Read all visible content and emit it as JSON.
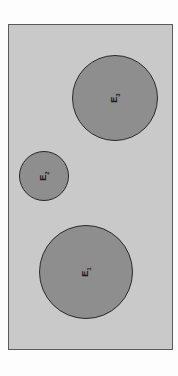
{
  "diagram": {
    "background_color": "#c9c9c9",
    "circle_fill": "#8e8e8e",
    "circles": [
      {
        "id": "E3",
        "letter": "E",
        "subscript": "3",
        "cx": 115,
        "cy": 98,
        "r": 43
      },
      {
        "id": "E2",
        "letter": "E",
        "subscript": "2",
        "cx": 44,
        "cy": 176,
        "r": 25
      },
      {
        "id": "E1",
        "letter": "E",
        "subscript": "1",
        "cx": 86,
        "cy": 272,
        "r": 47
      }
    ]
  }
}
